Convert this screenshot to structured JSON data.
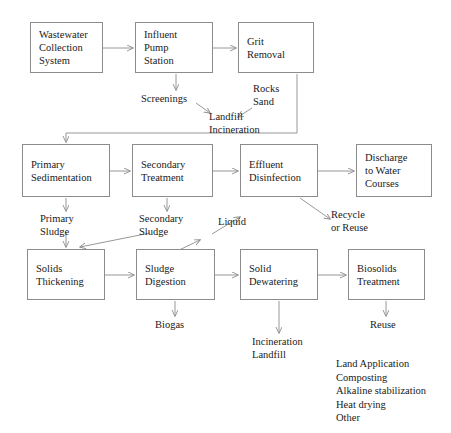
{
  "diagram": {
    "line_color": "#8c8c8c",
    "text_color": "#1a1a1a",
    "background": "#ffffff"
  },
  "nodes": {
    "wastewater_collection": {
      "lines": [
        "Wastewater",
        "Collection",
        "System"
      ]
    },
    "influent_pump": {
      "lines": [
        "Influent",
        "Pump",
        "Station"
      ]
    },
    "grit_removal": {
      "lines": [
        "Grit",
        "Removal"
      ]
    },
    "primary_sedimentation": {
      "lines": [
        "Primary",
        "Sedimentation"
      ]
    },
    "secondary_treatment": {
      "lines": [
        "Secondary",
        "Treatment"
      ]
    },
    "effluent_disinfection": {
      "lines": [
        "Effluent",
        "Disinfection"
      ]
    },
    "discharge_water_courses": {
      "lines": [
        "Discharge",
        "to Water",
        "Courses"
      ]
    },
    "solids_thickening": {
      "lines": [
        "Solids",
        "Thickening"
      ]
    },
    "sludge_digestion": {
      "lines": [
        "Sludge",
        "Digestion"
      ]
    },
    "solid_dewatering": {
      "lines": [
        "Solid",
        "Dewatering"
      ]
    },
    "biosolids_treatment": {
      "lines": [
        "Biosolids",
        "Treatment"
      ]
    }
  },
  "labels": {
    "screenings": {
      "lines": [
        "Screenings"
      ]
    },
    "rocks_sand": {
      "lines": [
        "Rocks",
        "Sand"
      ]
    },
    "landfill_incineration": {
      "lines": [
        "Landfill",
        "Incineration"
      ]
    },
    "primary_sludge": {
      "lines": [
        "Primary",
        "Sludge"
      ]
    },
    "secondary_sludge": {
      "lines": [
        "Secondary",
        "Sludge"
      ]
    },
    "liquid": {
      "lines": [
        "Liquid"
      ]
    },
    "recycle_or_reuse": {
      "lines": [
        "Recycle",
        "or Reuse"
      ]
    },
    "biogas": {
      "lines": [
        "Biogas"
      ]
    },
    "incineration_landfill": {
      "lines": [
        "Incineration",
        "Landfill"
      ]
    },
    "reuse": {
      "lines": [
        "Reuse"
      ]
    }
  },
  "biosolids_options": {
    "items": [
      "Land Application",
      "Composting",
      "Alkaline stabilization",
      "Heat drying",
      "Other"
    ]
  }
}
